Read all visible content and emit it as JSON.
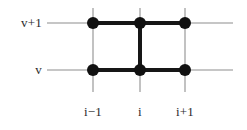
{
  "figure": {
    "kind": "lattice-diagram",
    "background_color": "#ffffff",
    "grid_line_color": "#b3b3b3",
    "edge_color": "#161616",
    "node_color": "#111111",
    "label_color": "#2b2b2b"
  },
  "row_labels": [
    {
      "id": "v-plus-1",
      "text": "v+1",
      "y": 23
    },
    {
      "id": "v",
      "text": "v",
      "y": 70
    }
  ],
  "column_labels": [
    {
      "id": "i-minus-1",
      "text": "i−1",
      "x": 93
    },
    {
      "id": "i",
      "text": "i",
      "x": 140
    },
    {
      "id": "i-plus-1",
      "text": "i+1",
      "x": 185
    }
  ],
  "grid": {
    "horizontal_lines": [
      {
        "id": "grid-row-v-plus-1",
        "y": 23,
        "x1": 47,
        "x2": 233
      },
      {
        "id": "grid-row-v",
        "y": 70,
        "x1": 47,
        "x2": 233
      }
    ],
    "vertical_lines": [
      {
        "id": "grid-col-i-minus-1",
        "x": 93,
        "y1": 8,
        "y2": 92
      },
      {
        "id": "grid-col-i",
        "x": 140,
        "y1": 8,
        "y2": 92
      },
      {
        "id": "grid-col-i-plus-1",
        "x": 185,
        "y1": 8,
        "y2": 92
      }
    ]
  },
  "nodes": [
    {
      "id": "node-im1-vp1",
      "column": "i−1",
      "row": "v+1",
      "x": 93,
      "y": 23,
      "r": 6
    },
    {
      "id": "node-i-vp1",
      "column": "i",
      "row": "v+1",
      "x": 140,
      "y": 23,
      "r": 6
    },
    {
      "id": "node-ip1-vp1",
      "column": "i+1",
      "row": "v+1",
      "x": 185,
      "y": 23,
      "r": 6
    },
    {
      "id": "node-im1-v",
      "column": "i−1",
      "row": "v",
      "x": 93,
      "y": 70,
      "r": 6
    },
    {
      "id": "node-i-v",
      "column": "i",
      "row": "v",
      "x": 140,
      "y": 70,
      "r": 6
    },
    {
      "id": "node-ip1-v",
      "column": "i+1",
      "row": "v",
      "x": 185,
      "y": 70,
      "r": 6
    }
  ],
  "edges": [
    {
      "id": "edge-top",
      "from": "node-im1-vp1",
      "to": "node-ip1-vp1",
      "x1": 93,
      "y1": 23,
      "x2": 185,
      "y2": 23,
      "width": 4
    },
    {
      "id": "edge-bottom",
      "from": "node-im1-v",
      "to": "node-ip1-v",
      "x1": 93,
      "y1": 70,
      "x2": 185,
      "y2": 70,
      "width": 4
    },
    {
      "id": "edge-rung",
      "from": "node-i-vp1",
      "to": "node-i-v",
      "x1": 140,
      "y1": 23,
      "x2": 140,
      "y2": 70,
      "width": 4
    }
  ]
}
